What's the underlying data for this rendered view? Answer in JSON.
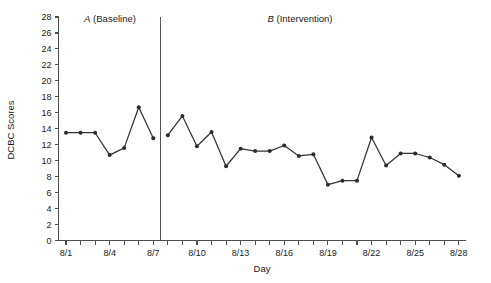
{
  "chart_data": {
    "type": "line",
    "title": "",
    "xlabel": "Day",
    "ylabel": "DCBC Scores",
    "ylim": [
      0,
      28
    ],
    "ytick_step": 2,
    "yticks": [
      0,
      2,
      4,
      6,
      8,
      10,
      12,
      14,
      16,
      18,
      20,
      22,
      24,
      26,
      28
    ],
    "ytick_labels": [
      "0",
      "2",
      "4",
      "6",
      "8",
      "10",
      "12",
      "14",
      "16",
      "18",
      "20",
      "22",
      "24",
      "26",
      "28"
    ],
    "grid": false,
    "legend": "none",
    "x": [
      "8/1",
      "8/2",
      "8/3",
      "8/4",
      "8/5",
      "8/6",
      "8/7",
      "8/8",
      "8/9",
      "8/10",
      "8/11",
      "8/12",
      "8/13",
      "8/14",
      "8/15",
      "8/16",
      "8/17",
      "8/18",
      "8/19",
      "8/20",
      "8/21",
      "8/22",
      "8/23",
      "8/24",
      "8/25",
      "8/26",
      "8/27",
      "8/28"
    ],
    "xtick_labels": [
      "8/1",
      "8/4",
      "8/7",
      "8/10",
      "8/13",
      "8/16",
      "8/19",
      "8/22",
      "8/25",
      "8/28"
    ],
    "xtick_label_every": 3,
    "series": [
      {
        "name": "DCBC Scores",
        "color": "#333333",
        "marker": "filled-circle",
        "values": [
          13.5,
          13.5,
          13.5,
          10.7,
          11.6,
          16.7,
          12.8,
          13.2,
          15.6,
          11.8,
          13.6,
          9.3,
          11.5,
          11.2,
          11.2,
          11.9,
          10.6,
          10.8,
          7.0,
          7.5,
          7.5,
          12.9,
          9.4,
          10.9,
          10.9,
          10.4,
          9.5,
          8.1
        ]
      }
    ],
    "phases": [
      {
        "id": "A",
        "letter": "A",
        "name": "(Baseline)",
        "label": "A (Baseline)",
        "start_x": "8/1",
        "end_x": "8/7",
        "n_points": 7
      },
      {
        "id": "B",
        "letter": "B",
        "name": "(Intervention)",
        "label": "B (Intervention)",
        "start_x": "8/8",
        "end_x": "8/28",
        "n_points": 21
      }
    ],
    "phase_change_line": {
      "between": [
        "8/7",
        "8/8"
      ],
      "color": "#555555"
    }
  }
}
